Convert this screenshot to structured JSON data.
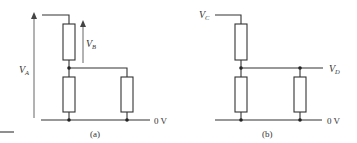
{
  "diagram": {
    "colors": {
      "line": "#333333",
      "background": "#ffffff"
    },
    "panel_a": {
      "caption": "(a)",
      "labels": {
        "va_main": "V",
        "va_sub": "A",
        "vb_main": "V",
        "vb_sub": "B",
        "ground": "0 V"
      }
    },
    "panel_b": {
      "caption": "(b)",
      "labels": {
        "vc_main": "V",
        "vc_sub": "C",
        "vd_main": "V",
        "vd_sub": "D",
        "ground": "0 V"
      }
    }
  }
}
